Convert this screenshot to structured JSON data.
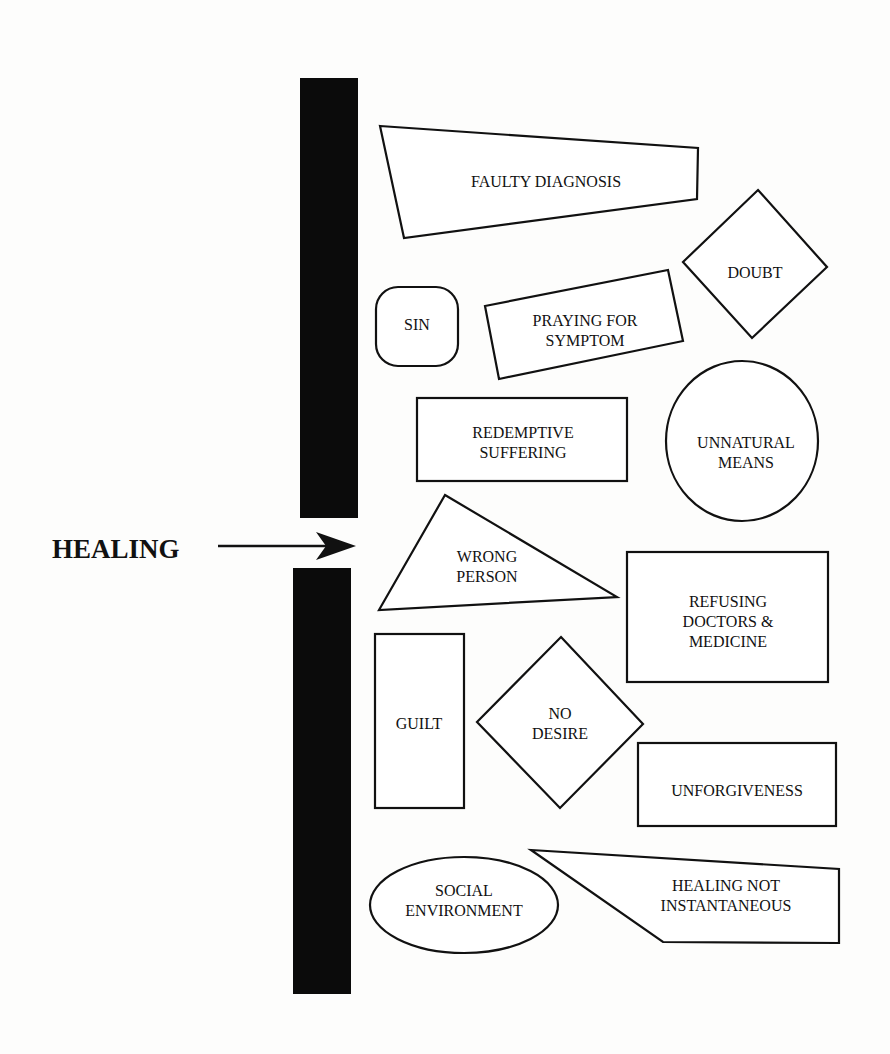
{
  "diagram": {
    "subject": "HEALING",
    "barrier": "wall",
    "obstacles": [
      {
        "id": "faulty-diagnosis",
        "shape": "trapezoid",
        "lines": [
          "FAULTY DIAGNOSIS"
        ]
      },
      {
        "id": "doubt",
        "shape": "diamond",
        "lines": [
          "DOUBT"
        ]
      },
      {
        "id": "sin",
        "shape": "rounded-square",
        "lines": [
          "SIN"
        ]
      },
      {
        "id": "praying-for-symptom",
        "shape": "tilted-rectangle",
        "lines": [
          "PRAYING FOR",
          "SYMPTOM"
        ]
      },
      {
        "id": "redemptive-suffering",
        "shape": "rectangle",
        "lines": [
          "REDEMPTIVE",
          "SUFFERING"
        ]
      },
      {
        "id": "unnatural-means",
        "shape": "circle",
        "lines": [
          "UNNATURAL",
          "MEANS"
        ]
      },
      {
        "id": "wrong-person",
        "shape": "triangle",
        "lines": [
          "WRONG",
          "PERSON"
        ]
      },
      {
        "id": "refusing-doctors",
        "shape": "rectangle",
        "lines": [
          "REFUSING",
          "DOCTORS &",
          "MEDICINE"
        ]
      },
      {
        "id": "guilt",
        "shape": "tall-rectangle",
        "lines": [
          "GUILT"
        ]
      },
      {
        "id": "no-desire",
        "shape": "diamond",
        "lines": [
          "NO",
          "DESIRE"
        ]
      },
      {
        "id": "unforgiveness",
        "shape": "rectangle",
        "lines": [
          "UNFORGIVENESS"
        ]
      },
      {
        "id": "social-environment",
        "shape": "ellipse",
        "lines": [
          "SOCIAL",
          "ENVIRONMENT"
        ]
      },
      {
        "id": "healing-not-instantaneous",
        "shape": "pentagon",
        "lines": [
          "HEALING NOT",
          "INSTANTANEOUS"
        ]
      }
    ]
  },
  "colors": {
    "ink": "#111111",
    "paper": "#fdfdfc"
  }
}
